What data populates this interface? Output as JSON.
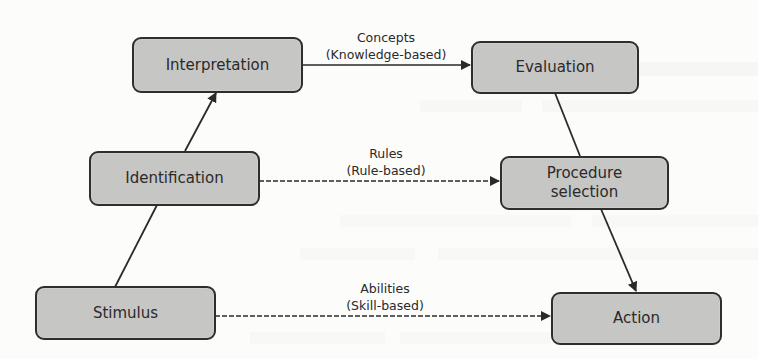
{
  "diagram": {
    "type": "flow",
    "colors": {
      "node_fill": "#c6c6c4",
      "node_border": "#2e2e2e",
      "text": "#2a2a2a",
      "edge": "#2a2a2a",
      "background": "#fcfcfb"
    },
    "nodes": [
      {
        "id": "interpretation",
        "label": "Interpretation"
      },
      {
        "id": "evaluation",
        "label": "Evaluation"
      },
      {
        "id": "identification",
        "label": "Identification"
      },
      {
        "id": "procedure_selection",
        "label": "Procedure\nselection"
      },
      {
        "id": "stimulus",
        "label": "Stimulus"
      },
      {
        "id": "action",
        "label": "Action"
      }
    ],
    "edges": [
      {
        "from": "stimulus",
        "to": "identification",
        "style": "solid",
        "arrow": false,
        "label": ""
      },
      {
        "from": "identification",
        "to": "interpretation",
        "style": "solid",
        "arrow": true,
        "label": ""
      },
      {
        "from": "interpretation",
        "to": "evaluation",
        "style": "solid",
        "arrow": true,
        "label_line1": "Concepts",
        "label_line2": "(Knowledge-based)"
      },
      {
        "from": "evaluation",
        "to": "procedure_selection",
        "style": "solid",
        "arrow": false,
        "label": ""
      },
      {
        "from": "identification",
        "to": "procedure_selection",
        "style": "dashed",
        "arrow": true,
        "label_line1": "Rules",
        "label_line2": "(Rule-based)"
      },
      {
        "from": "procedure_selection",
        "to": "action",
        "style": "solid",
        "arrow": true,
        "label": ""
      },
      {
        "from": "stimulus",
        "to": "action",
        "style": "dashed",
        "arrow": true,
        "label_line1": "Abilities",
        "label_line2": "(Skill-based)"
      }
    ]
  }
}
